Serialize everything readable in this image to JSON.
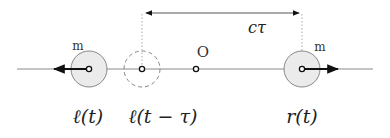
{
  "diagram": {
    "title": "",
    "colors": {
      "axis": "#888888",
      "arrow": "#111111",
      "mass_fill": "#ebebeb",
      "mass_stroke": "#888888",
      "guide": "#aaaaaa",
      "text": "#222222"
    },
    "distance_label": "cτ",
    "origin_label": "O",
    "masses": [
      {
        "id": "left",
        "label": "m",
        "position_label": "ℓ(t)",
        "style": "solid",
        "direction": "left"
      },
      {
        "id": "left-retarded",
        "label": "",
        "position_label": "ℓ(t − τ)",
        "style": "dashed",
        "direction": "none"
      },
      {
        "id": "right",
        "label": "m",
        "position_label": "r(t)",
        "style": "solid",
        "direction": "right"
      }
    ]
  }
}
